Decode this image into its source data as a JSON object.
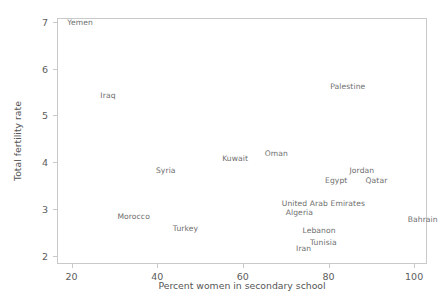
{
  "chart_data": {
    "type": "scatter",
    "title": "",
    "xlabel": "Percent women in secondary school",
    "ylabel": "Total fertility rate",
    "xlim": [
      16.6,
      103.0
    ],
    "ylim": [
      1.82,
      7.08
    ],
    "xticks": [
      20,
      40,
      60,
      80,
      100
    ],
    "yticks": [
      2,
      3,
      4,
      5,
      6,
      7
    ],
    "grid": false,
    "legend": null,
    "marker_style": "text-label-only",
    "points": [
      {
        "label": "Yemen",
        "x": 22.0,
        "y": 7.0
      },
      {
        "label": "Iraq",
        "x": 28.5,
        "y": 5.43
      },
      {
        "label": "Palestine",
        "x": 84.5,
        "y": 5.62
      },
      {
        "label": "Syria",
        "x": 42.0,
        "y": 3.84
      },
      {
        "label": "Kuwait",
        "x": 58.2,
        "y": 4.08
      },
      {
        "label": "Oman",
        "x": 67.8,
        "y": 4.2
      },
      {
        "label": "Jordan",
        "x": 87.8,
        "y": 3.84
      },
      {
        "label": "Egypt",
        "x": 81.8,
        "y": 3.61
      },
      {
        "label": "Qatar",
        "x": 91.2,
        "y": 3.61
      },
      {
        "label": "United Arab Emirates",
        "x": 78.8,
        "y": 3.13
      },
      {
        "label": "Algeria",
        "x": 73.2,
        "y": 2.93
      },
      {
        "label": "Morocco",
        "x": 34.5,
        "y": 2.84
      },
      {
        "label": "Turkey",
        "x": 46.6,
        "y": 2.58
      },
      {
        "label": "Lebanon",
        "x": 77.8,
        "y": 2.55
      },
      {
        "label": "Tunisia",
        "x": 78.8,
        "y": 2.28
      },
      {
        "label": "Iran",
        "x": 74.2,
        "y": 2.17
      },
      {
        "label": "Bahrain",
        "x": 102.0,
        "y": 2.78
      }
    ]
  },
  "axes": {
    "ylabel": "Total fertility rate",
    "xlabel": "Percent women in secondary school",
    "ytick_labels": [
      "7",
      "6",
      "5",
      "4",
      "3",
      "2"
    ],
    "xtick_labels": [
      "20",
      "40",
      "60",
      "80",
      "100"
    ]
  },
  "colors": {
    "frame": "#c9c9c9",
    "label_text": "#6e6e6e",
    "tick_text": "#5c5c5c",
    "axis_title": "#555555",
    "background": "#ffffff"
  }
}
